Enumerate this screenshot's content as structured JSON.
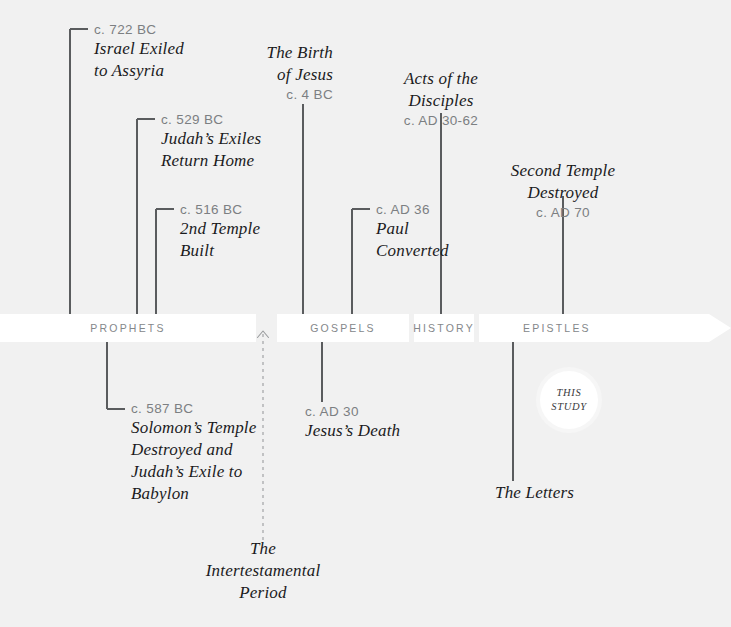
{
  "diagram": {
    "background_color": "#f1f1f1",
    "bar_color": "#ffffff",
    "line_color": "#5a5c5e",
    "date_color": "#7c7f82",
    "title_color": "#1b1b1d",
    "segment_label_color": "#84878a"
  },
  "bar": {
    "segments": [
      {
        "label": "PROPHETS"
      },
      {
        "label": "GOSPELS"
      },
      {
        "label": "HISTORY"
      },
      {
        "label": "EPISTLES"
      }
    ]
  },
  "events_above": [
    {
      "date": "c. 722 BC",
      "title_lines": [
        "Israel Exiled",
        "to Assyria"
      ],
      "align": "left"
    },
    {
      "date": "c. 529 BC",
      "title_lines": [
        "Judah’s Exiles",
        "Return Home"
      ],
      "align": "left"
    },
    {
      "date": "c. 516 BC",
      "title_lines": [
        "2nd Temple",
        "Built"
      ],
      "align": "left"
    },
    {
      "date": "c. 4 BC",
      "title_lines": [
        "The Birth",
        "of Jesus"
      ],
      "align": "right"
    },
    {
      "date": "c. AD 30-62",
      "title_lines": [
        "Acts of the",
        "Disciples"
      ],
      "align": "center"
    },
    {
      "date": "c. AD 36",
      "title_lines": [
        "Paul",
        "Converted"
      ],
      "align": "left"
    },
    {
      "date": "c. AD 70",
      "title_lines": [
        "Second Temple",
        "Destroyed"
      ],
      "align": "center"
    }
  ],
  "events_below": [
    {
      "date": "c. 587 BC",
      "title_lines": [
        "Solomon’s Temple",
        "Destroyed and",
        "Judah’s Exile to",
        "Babylon"
      ],
      "align": "left"
    },
    {
      "date": "c. AD 30",
      "title_lines": [
        "Jesus’s Death"
      ],
      "align": "left"
    },
    {
      "date": "",
      "title_lines": [
        "The Letters"
      ],
      "align": "left"
    }
  ],
  "intertestamental": {
    "title_lines": [
      "The",
      "Intertestamental",
      "Period"
    ]
  },
  "badge": {
    "line1": "THIS",
    "line2": "STUDY"
  }
}
